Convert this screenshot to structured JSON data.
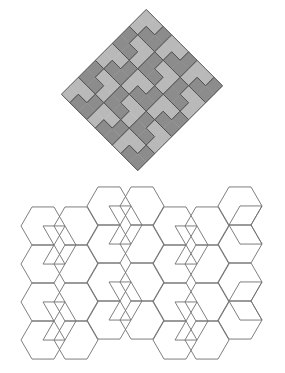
{
  "figure": {
    "top_caption_fragment": "",
    "colors": {
      "tile_light": "#b9b9b9",
      "tile_dark": "#8c8c8c",
      "tile_stroke": "#505050",
      "line_stroke": "#707070",
      "background": "#ffffff"
    },
    "l_tiling": {
      "center_x": 142,
      "center_y": 90,
      "unit": 12,
      "rotation_deg": 45,
      "tiles": [
        {
          "cells": [
            [
              0,
              0
            ],
            [
              1,
              0
            ],
            [
              0,
              1
            ]
          ],
          "shade": "light"
        },
        {
          "cells": [
            [
              2,
              0
            ],
            [
              2,
              1
            ],
            [
              1,
              1
            ]
          ],
          "shade": "dark"
        },
        {
          "cells": [
            [
              3,
              0
            ],
            [
              4,
              0
            ],
            [
              3,
              1
            ]
          ],
          "shade": "light"
        },
        {
          "cells": [
            [
              5,
              0
            ],
            [
              5,
              1
            ],
            [
              4,
              1
            ]
          ],
          "shade": "dark"
        },
        {
          "cells": [
            [
              6,
              0
            ],
            [
              7,
              0
            ],
            [
              6,
              1
            ]
          ],
          "shade": "light"
        },
        {
          "cells": [
            [
              8,
              0
            ],
            [
              8,
              1
            ],
            [
              7,
              1
            ]
          ],
          "shade": "dark"
        },
        {
          "cells": [
            [
              0,
              2
            ],
            [
              0,
              3
            ],
            [
              1,
              3
            ]
          ],
          "shade": "dark"
        },
        {
          "cells": [
            [
              1,
              2
            ],
            [
              2,
              2
            ],
            [
              2,
              3
            ]
          ],
          "shade": "light"
        },
        {
          "cells": [
            [
              3,
              2
            ],
            [
              3,
              3
            ],
            [
              4,
              3
            ]
          ],
          "shade": "dark"
        },
        {
          "cells": [
            [
              4,
              2
            ],
            [
              5,
              2
            ],
            [
              5,
              3
            ]
          ],
          "shade": "light"
        },
        {
          "cells": [
            [
              6,
              2
            ],
            [
              6,
              3
            ],
            [
              7,
              3
            ]
          ],
          "shade": "dark"
        },
        {
          "cells": [
            [
              7,
              2
            ],
            [
              8,
              2
            ],
            [
              8,
              3
            ]
          ],
          "shade": "light"
        },
        {
          "cells": [
            [
              0,
              4
            ],
            [
              1,
              4
            ],
            [
              0,
              5
            ]
          ],
          "shade": "light"
        },
        {
          "cells": [
            [
              2,
              4
            ],
            [
              2,
              5
            ],
            [
              1,
              5
            ]
          ],
          "shade": "dark"
        },
        {
          "cells": [
            [
              3,
              4
            ],
            [
              4,
              4
            ],
            [
              3,
              5
            ]
          ],
          "shade": "light"
        },
        {
          "cells": [
            [
              5,
              4
            ],
            [
              5,
              5
            ],
            [
              4,
              5
            ]
          ],
          "shade": "dark"
        },
        {
          "cells": [
            [
              6,
              4
            ],
            [
              7,
              4
            ],
            [
              6,
              5
            ]
          ],
          "shade": "light"
        },
        {
          "cells": [
            [
              8,
              4
            ],
            [
              8,
              5
            ],
            [
              7,
              5
            ]
          ],
          "shade": "dark"
        },
        {
          "cells": [
            [
              0,
              6
            ],
            [
              0,
              7
            ],
            [
              1,
              7
            ]
          ],
          "shade": "dark"
        },
        {
          "cells": [
            [
              1,
              6
            ],
            [
              2,
              6
            ],
            [
              2,
              7
            ]
          ],
          "shade": "light"
        },
        {
          "cells": [
            [
              3,
              6
            ],
            [
              3,
              7
            ],
            [
              4,
              7
            ]
          ],
          "shade": "dark"
        },
        {
          "cells": [
            [
              4,
              6
            ],
            [
              5,
              6
            ],
            [
              5,
              7
            ]
          ],
          "shade": "light"
        },
        {
          "cells": [
            [
              6,
              6
            ],
            [
              6,
              7
            ],
            [
              7,
              7
            ]
          ],
          "shade": "dark"
        },
        {
          "cells": [
            [
              7,
              6
            ],
            [
              8,
              6
            ],
            [
              8,
              7
            ]
          ],
          "shade": "light"
        },
        {
          "cells": [
            [
              0,
              8
            ],
            [
              1,
              8
            ],
            [
              0,
              9
            ]
          ],
          "shade": "light"
        },
        {
          "cells": [
            [
              2,
              8
            ],
            [
              2,
              9
            ],
            [
              1,
              9
            ]
          ],
          "shade": "dark"
        },
        {
          "cells": [
            [
              3,
              8
            ],
            [
              4,
              8
            ],
            [
              3,
              9
            ]
          ],
          "shade": "light"
        },
        {
          "cells": [
            [
              5,
              8
            ],
            [
              5,
              9
            ],
            [
              4,
              9
            ]
          ],
          "shade": "dark"
        },
        {
          "cells": [
            [
              6,
              8
            ],
            [
              7,
              8
            ],
            [
              6,
              9
            ]
          ],
          "shade": "light"
        },
        {
          "cells": [
            [
              8,
              8
            ],
            [
              8,
              9
            ],
            [
              7,
              9
            ]
          ],
          "shade": "dark"
        }
      ]
    },
    "hex_tiling": {
      "side": 22,
      "columns": [
        {
          "cx": 43,
          "top_centers": [
            226,
            264,
            302,
            340
          ]
        },
        {
          "cx": 76,
          "top_centers": [
            226,
            264,
            302,
            340
          ]
        },
        {
          "cx": 109,
          "top_centers": [
            206,
            244,
            282,
            320
          ]
        },
        {
          "cx": 142,
          "top_centers": [
            206,
            244,
            282,
            320
          ]
        },
        {
          "cx": 175,
          "top_centers": [
            226,
            264,
            302,
            340
          ]
        },
        {
          "cx": 207,
          "top_centers": [
            226,
            264,
            302,
            340
          ]
        },
        {
          "cx": 240,
          "top_centers": [
            206,
            244,
            282,
            320
          ]
        }
      ],
      "chevrons": [
        {
          "x": 54,
          "y": 245,
          "dir": 1
        },
        {
          "x": 54,
          "y": 321,
          "dir": 1
        },
        {
          "x": 120,
          "y": 225,
          "dir": 1
        },
        {
          "x": 120,
          "y": 301,
          "dir": 1
        },
        {
          "x": 186,
          "y": 245,
          "dir": 1
        },
        {
          "x": 186,
          "y": 321,
          "dir": 1
        },
        {
          "x": 251,
          "y": 225,
          "dir": -1
        },
        {
          "x": 251,
          "y": 301,
          "dir": -1
        }
      ]
    }
  }
}
